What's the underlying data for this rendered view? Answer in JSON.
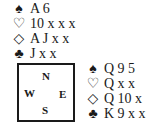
{
  "north": {
    "spades": {
      "symbol": "♠",
      "cards": "A 6"
    },
    "hearts": {
      "symbol": "♡",
      "cards": "10 x x x"
    },
    "diamonds": {
      "symbol": "◇",
      "cards": "A J x x"
    },
    "clubs": {
      "symbol": "♣",
      "cards": "J x x"
    }
  },
  "east": {
    "spades": {
      "symbol": "♠",
      "cards": "Q 9 5"
    },
    "hearts": {
      "symbol": "♡",
      "cards": "Q x x"
    },
    "diamonds": {
      "symbol": "◇",
      "cards": "Q 10 x"
    },
    "clubs": {
      "symbol": "♣",
      "cards": "K 9 x x"
    }
  },
  "compass": {
    "n": "N",
    "w": "W",
    "e": "E",
    "s": "S"
  }
}
